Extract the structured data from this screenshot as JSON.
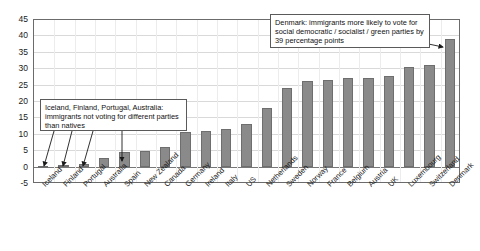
{
  "chart_data": {
    "type": "bar",
    "title": "",
    "subtitle": "",
    "xlabel": "",
    "ylabel": "",
    "ylim": [
      -5,
      45
    ],
    "ytick_values": [
      45,
      40,
      35,
      30,
      25,
      20,
      15,
      10,
      5,
      0,
      -5
    ],
    "ytick_labels": [
      "45",
      "40",
      "35",
      "30",
      "25",
      "20",
      "15",
      "10",
      "5",
      "0",
      "-5"
    ],
    "grid": true,
    "legend": "none",
    "bar_color": "#8a8a8a",
    "categories": [
      "Iceland",
      "Finland",
      "Portugal",
      "Australia",
      "Spain",
      "New Zealand",
      "Canada",
      "Germany",
      "Ireland",
      "Italy",
      "US",
      "Netherlands",
      "Sweden",
      "Norway",
      "France",
      "Belgium",
      "Austria",
      "UK",
      "Luxembourg",
      "Switzerland",
      "Denmark"
    ],
    "values": [
      0.1,
      0.4,
      0.8,
      2.6,
      4.5,
      4.8,
      6.0,
      10.5,
      11.0,
      11.5,
      13.0,
      18.0,
      24.0,
      26.0,
      26.5,
      27.0,
      27.0,
      27.5,
      30.5,
      31.0,
      39.0
    ],
    "annotations": [
      {
        "id": "left",
        "text": "Iceland, Finland, Portugal, Australia: immigrants not voting for different parties than natives",
        "points_to": [
          "Iceland",
          "Finland",
          "Portugal",
          "Australia"
        ]
      },
      {
        "id": "right",
        "text": "Denmark: immigrants more likely to vote for social democratic / socialist / green parties by 39 percentage points",
        "points_to": [
          "Denmark"
        ]
      }
    ]
  }
}
